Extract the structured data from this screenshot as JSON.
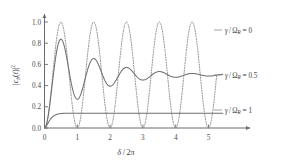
{
  "chart_data": {
    "type": "line",
    "title": "",
    "xlabel": "δ / 2π",
    "ylabel": "|c_b(t)|²",
    "ylabel_parts": {
      "bar1": "|",
      "c": "c",
      "b": "b",
      "open": "(",
      "t": "t",
      "close": ")",
      "bar2": "|",
      "pow": "2"
    },
    "xlabel_parts": {
      "delta": "δ",
      "slash": "/",
      "two": "2",
      "pi": "π"
    },
    "xlim": [
      0,
      5.6
    ],
    "ylim": [
      0,
      1.05
    ],
    "xticks": [
      0,
      1,
      2,
      3,
      4,
      5
    ],
    "xticklabels": [
      "0",
      "1",
      "2",
      "3",
      "4",
      "5"
    ],
    "yticks": [
      0.0,
      0.2,
      0.4,
      0.6,
      0.8,
      1.0
    ],
    "yticklabels": [
      "0.0",
      "0.2",
      "0.4",
      "0.6",
      "0.8",
      "1.0"
    ],
    "grid": false,
    "legend_position": "right-inline",
    "axis_arrows": true,
    "series": [
      {
        "name": "γ/Ω_R = 0",
        "gamma_ratio": 0,
        "style": "dotted",
        "color": "#8d8d8d",
        "description": "Undamped Rabi oscillation, sin^2(pi*x), peaks of 1.0 at x=0.5,1.5,2.5,3.5,4.5 and zeros at x=0,1,2,3,4,5",
        "peak_value": 1.0,
        "trough_value": 0.0,
        "peak_x": [
          0.5,
          1.5,
          2.5,
          3.5,
          4.5
        ],
        "zero_x": [
          0,
          1,
          2,
          3,
          4,
          5
        ],
        "label_parts": {
          "gamma": "γ",
          "slash": "/",
          "omega": "Ω",
          "sub": "R",
          "eq": "= 0"
        }
      },
      {
        "name": "γ/Ω_R = 0.5",
        "gamma_ratio": 0.5,
        "style": "solid",
        "color": "#6f6f6f",
        "description": "Damped Rabi oscillation relaxing to 0.5; first maximum 0.68 at x=0.47, first minimum 0.39 at x=1.0",
        "asymptote": 0.5,
        "peaks": [
          {
            "x": 0.47,
            "y": 0.68
          },
          {
            "x": 1.5,
            "y": 0.565
          },
          {
            "x": 2.5,
            "y": 0.54
          },
          {
            "x": 3.5,
            "y": 0.525
          },
          {
            "x": 4.5,
            "y": 0.515
          }
        ],
        "troughs": [
          {
            "x": 1.0,
            "y": 0.39
          },
          {
            "x": 2.0,
            "y": 0.435
          },
          {
            "x": 3.0,
            "y": 0.46
          },
          {
            "x": 4.0,
            "y": 0.475
          },
          {
            "x": 5.0,
            "y": 0.485
          }
        ],
        "label_parts": {
          "gamma": "γ",
          "slash": "/",
          "omega": "Ω",
          "sub": "R",
          "eq": "= 0.5"
        }
      },
      {
        "name": "γ/Ω_R = 1",
        "gamma_ratio": 1,
        "style": "solid",
        "color": "#6f6f6f",
        "description": "Overdamped, monotonic rise saturating at a plateau of about 0.14",
        "asymptote": 0.14,
        "rise_x": 0.35,
        "label_parts": {
          "gamma": "γ",
          "slash": "/",
          "omega": "Ω",
          "sub": "R",
          "eq": "= 1"
        }
      }
    ]
  },
  "colors": {
    "axis": "#6b6b6b",
    "curve_dotted": "#8d8d8d",
    "curve_solid": "#6f6f6f",
    "text": "#3f3f3f",
    "background": "#ffffff"
  }
}
